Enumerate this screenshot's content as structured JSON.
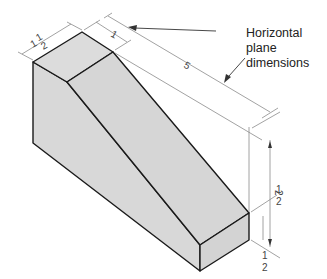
{
  "figure": {
    "type": "isometric-drawing",
    "callout": {
      "line1": "Horizontal plane",
      "line2": "dimensions"
    },
    "dimensions": {
      "depth_top_label": "1 1/2",
      "depth_top_whole": "1",
      "depth_top_num": "1",
      "depth_top_den": "2",
      "top_width": "1",
      "length": "5",
      "height_total": "2 1/2",
      "height_total_whole": "2",
      "height_total_num": "1",
      "height_total_den": "2",
      "base_height": "1/2",
      "base_height_num": "1",
      "base_height_den": "2"
    },
    "colors": {
      "face_fill": "#d9d9d9",
      "edge": "#1a1a1a",
      "dim_line": "#888888",
      "text": "#222222"
    }
  }
}
